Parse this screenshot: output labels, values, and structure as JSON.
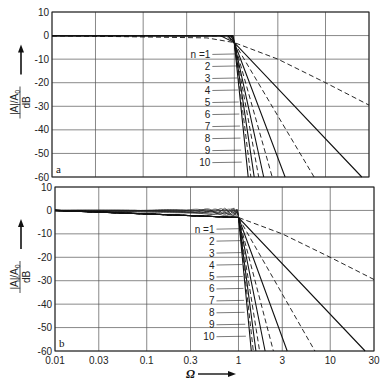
{
  "chart_data": [
    {
      "type": "line",
      "panel": "a",
      "title": "",
      "xlabel": "Ω",
      "ylabel": "|A|/A0 / dB",
      "xscale": "log",
      "xlim": [
        0.01,
        30
      ],
      "ylim": [
        -60,
        10
      ],
      "x_ticks": [
        "0.01",
        "0.03",
        "0.1",
        "0.3",
        "1",
        "3",
        "10",
        "30"
      ],
      "y_ticks": [
        "10",
        "0",
        "-10",
        "-20",
        "-30",
        "-40",
        "-50",
        "-60"
      ],
      "grid": true,
      "legend": "inline leader labels",
      "series": [
        {
          "name": "n=1",
          "style": "dashed",
          "x": [
            0.01,
            0.5,
            1,
            3,
            10,
            30
          ],
          "y": [
            0,
            -1,
            -3,
            -10,
            -20,
            -29.5
          ]
        },
        {
          "name": "n=2",
          "style": "solid",
          "x": [
            0.01,
            0.7,
            1,
            25
          ],
          "y": [
            0,
            0,
            -3,
            -60
          ]
        },
        {
          "name": "n=3",
          "style": "dashed",
          "x": [
            0.01,
            0.8,
            1,
            7.5
          ],
          "y": [
            0,
            0,
            -3,
            -60
          ]
        },
        {
          "name": "n=4",
          "style": "solid",
          "x": [
            0.01,
            0.85,
            1,
            3.6
          ],
          "y": [
            0,
            0,
            -3,
            -60
          ]
        },
        {
          "name": "n=5",
          "style": "dashed",
          "x": [
            0.01,
            0.9,
            1,
            2.6
          ],
          "y": [
            0,
            0,
            -3,
            -60
          ]
        },
        {
          "name": "n=6",
          "style": "solid",
          "x": [
            0.01,
            0.92,
            1,
            2.1
          ],
          "y": [
            0,
            0,
            -3,
            -60
          ]
        },
        {
          "name": "n=7",
          "style": "dashed",
          "x": [
            0.01,
            0.94,
            1,
            1.85
          ],
          "y": [
            0,
            0,
            -3,
            -60
          ]
        },
        {
          "name": "n=8",
          "style": "solid",
          "x": [
            0.01,
            0.95,
            1,
            1.65
          ],
          "y": [
            0,
            0,
            -3,
            -60
          ]
        },
        {
          "name": "n=9",
          "style": "dashed",
          "x": [
            0.01,
            0.96,
            1,
            1.52
          ],
          "y": [
            0,
            0,
            -3,
            -60
          ]
        },
        {
          "name": "n=10",
          "style": "solid",
          "x": [
            0.01,
            0.97,
            1,
            1.42
          ],
          "y": [
            0,
            0,
            -3,
            -60
          ]
        }
      ]
    },
    {
      "type": "line",
      "panel": "b",
      "title": "",
      "xlabel": "Ω",
      "ylabel": "|A|/A0 / dB",
      "xscale": "log",
      "xlim": [
        0.01,
        30
      ],
      "ylim": [
        -60,
        10
      ],
      "x_ticks": [
        "0.01",
        "0.03",
        "0.1",
        "0.3",
        "1",
        "3",
        "10",
        "30"
      ],
      "y_ticks": [
        "10",
        "0",
        "-10",
        "-20",
        "-30",
        "-40",
        "-50",
        "-60"
      ],
      "grid": true,
      "legend": "inline leader labels",
      "passband_ripple_db": 3,
      "series": [
        {
          "name": "n=1",
          "style": "dashed",
          "x": [
            0.01,
            1,
            3,
            10,
            30
          ],
          "y": [
            0,
            -3,
            -10,
            -20,
            -29.5
          ]
        },
        {
          "name": "n=2",
          "style": "solid",
          "x": [
            0.01,
            1,
            24
          ],
          "y": [
            0,
            -3,
            -60
          ]
        },
        {
          "name": "n=3",
          "style": "dashed",
          "x": [
            0.01,
            1,
            6.8
          ],
          "y": [
            0,
            -3,
            -60
          ]
        },
        {
          "name": "n=4",
          "style": "solid",
          "x": [
            0.01,
            1,
            3.4
          ],
          "y": [
            0,
            -3,
            -60
          ]
        },
        {
          "name": "n=5",
          "style": "dashed",
          "x": [
            0.01,
            1,
            2.4
          ],
          "y": [
            0,
            -3,
            -60
          ]
        },
        {
          "name": "n=6",
          "style": "solid",
          "x": [
            0.01,
            1,
            1.95
          ],
          "y": [
            0,
            -3,
            -60
          ]
        },
        {
          "name": "n=7",
          "style": "dashed",
          "x": [
            0.01,
            1,
            1.7
          ],
          "y": [
            0,
            -3,
            -60
          ]
        },
        {
          "name": "n=8",
          "style": "solid",
          "x": [
            0.01,
            1,
            1.55
          ],
          "y": [
            0,
            -3,
            -60
          ]
        },
        {
          "name": "n=9",
          "style": "dashed",
          "x": [
            0.01,
            1,
            1.45
          ],
          "y": [
            0,
            -3,
            -60
          ]
        },
        {
          "name": "n=10",
          "style": "solid",
          "x": [
            0.01,
            1,
            1.38
          ],
          "y": [
            0,
            -3,
            -60
          ]
        }
      ]
    }
  ],
  "panels": [
    {
      "tag": "a",
      "ylabel_top": "|A|/A",
      "ylabel_sub": "0",
      "ylabel_bottom": "dB",
      "n_labels": [
        "n =1",
        "2",
        "3",
        "4",
        "5",
        "6",
        "7",
        "8",
        "9",
        "10"
      ]
    },
    {
      "tag": "b",
      "ylabel_top": "|A|/A",
      "ylabel_sub": "0",
      "ylabel_bottom": "dB",
      "n_labels": [
        "n =1",
        "2",
        "3",
        "4",
        "5",
        "6",
        "7",
        "8",
        "9",
        "10"
      ]
    }
  ],
  "axis": {
    "x_ticks": [
      "0.01",
      "0.03",
      "0.1",
      "0.3",
      "1",
      "3",
      "10",
      "30"
    ],
    "y_ticks": [
      "10",
      "0",
      "-10",
      "-20",
      "-30",
      "-40",
      "-50",
      "-60"
    ],
    "xlabel": "Ω"
  }
}
